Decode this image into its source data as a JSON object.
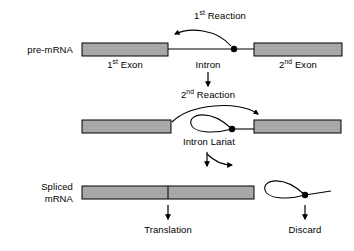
{
  "diagram": {
    "colors": {
      "exon_fill": "#a8a8a8",
      "stroke": "#000000",
      "background": "#ffffff"
    }
  },
  "labels": {
    "pre_mrna": "pre-mRNA",
    "first_exon_num": "1",
    "first_exon_sup": "st",
    "first_exon_rest": " Exon",
    "intron": "Intron",
    "second_exon_num": "2",
    "second_exon_sup": "nd",
    "second_exon_rest": " Exon",
    "first_reaction_num": "1",
    "first_reaction_sup": "st",
    "first_reaction_rest": " Reaction",
    "second_reaction_num": "2",
    "second_reaction_sup": "nd",
    "second_reaction_rest": " Reaction",
    "intron_lariat": "Intron Lariat",
    "spliced_mrna": "Spliced\nmRNA",
    "translation": "Translation",
    "discard": "Discard"
  },
  "shapes": {
    "row1": {
      "exon1": {
        "x": 82,
        "y": 43,
        "w": 86,
        "h": 13
      },
      "exon2": {
        "x": 254,
        "y": 43,
        "w": 88,
        "h": 13
      },
      "intron_line_y": 49,
      "branch_dot": {
        "cx": 234,
        "cy": 49,
        "r": 3.2
      }
    },
    "row2": {
      "exon1": {
        "x": 82,
        "y": 120,
        "w": 89,
        "h": 13
      },
      "exon2": {
        "x": 254,
        "y": 120,
        "w": 87,
        "h": 13
      },
      "branch_dot": {
        "cx": 232,
        "cy": 129,
        "r": 3.2
      }
    },
    "row3": {
      "spliced": {
        "x": 82,
        "y": 186,
        "w": 172,
        "h": 13
      },
      "junction_x": 168,
      "branch_dot": {
        "cx": 305,
        "cy": 195,
        "r": 3.2
      }
    }
  }
}
